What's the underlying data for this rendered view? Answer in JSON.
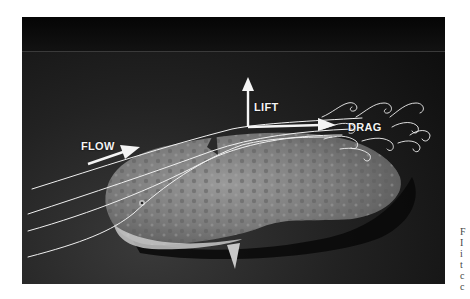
{
  "figure": {
    "labels": {
      "flow": "FLOW",
      "lift": "LIFT",
      "drag": "DRAG"
    },
    "arrows": [
      {
        "name": "flow-arrow",
        "direction": "right-up"
      },
      {
        "name": "lift-arrow",
        "direction": "up"
      },
      {
        "name": "drag-arrow",
        "direction": "right"
      }
    ],
    "streamline_count": 5,
    "wake_vortices": "curly turbulent eddies downstream of fish",
    "colors": {
      "overlay": "#f4f4f4",
      "background_dark": "#0b0b0b",
      "seafloor": "#2e2e2e",
      "fish": "#8a8a8a"
    }
  },
  "caption_fragment": {
    "chars": [
      "F",
      "I",
      "i",
      "t",
      "c",
      "c"
    ]
  }
}
